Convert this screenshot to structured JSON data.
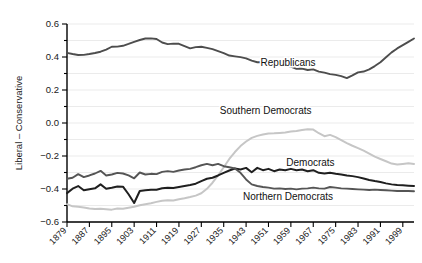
{
  "chart_data": {
    "type": "line",
    "title": "",
    "xlabel": "",
    "ylabel": "Liberal – Conservative",
    "xlim": [
      1879,
      2003
    ],
    "ylim": [
      -0.6,
      0.6
    ],
    "grid": true,
    "legend_position": "inline-annotations",
    "x_tick_labels": [
      "1879",
      "1887",
      "1895",
      "1903",
      "1911",
      "1919",
      "1927",
      "1935",
      "1943",
      "1951",
      "1959",
      "1967",
      "1975",
      "1983",
      "1991",
      "1999"
    ],
    "x_tick_values": [
      1879,
      1887,
      1895,
      1903,
      1911,
      1919,
      1927,
      1935,
      1943,
      1951,
      1959,
      1967,
      1975,
      1983,
      1991,
      1999
    ],
    "y_tick_labels": [
      "0.6",
      "0.4",
      "0.2",
      "0.0",
      "−0.2",
      "−0.4",
      "−0.6"
    ],
    "y_tick_values": [
      0.6,
      0.4,
      0.2,
      0.0,
      -0.2,
      -0.4,
      -0.6
    ],
    "y_minor_tick_values": [
      0.5,
      0.3,
      0.1,
      -0.1,
      -0.3,
      -0.5
    ],
    "x": [
      1879,
      1881,
      1883,
      1885,
      1887,
      1889,
      1891,
      1893,
      1895,
      1897,
      1899,
      1901,
      1903,
      1905,
      1907,
      1909,
      1911,
      1913,
      1915,
      1917,
      1919,
      1921,
      1923,
      1925,
      1927,
      1929,
      1931,
      1933,
      1935,
      1937,
      1939,
      1941,
      1943,
      1945,
      1947,
      1949,
      1951,
      1953,
      1955,
      1957,
      1959,
      1961,
      1963,
      1965,
      1967,
      1969,
      1971,
      1973,
      1975,
      1977,
      1979,
      1981,
      1983,
      1985,
      1987,
      1989,
      1991,
      1993,
      1995,
      1997,
      1999,
      2001,
      2003
    ],
    "series": [
      {
        "name": "Republicans",
        "color": "#4d4d4d",
        "width": 1.9,
        "label_x": 1958,
        "label_y": 0.345,
        "values": [
          0.425,
          0.418,
          0.412,
          0.413,
          0.418,
          0.424,
          0.432,
          0.445,
          0.462,
          0.463,
          0.468,
          0.479,
          0.492,
          0.503,
          0.512,
          0.513,
          0.509,
          0.488,
          0.478,
          0.481,
          0.48,
          0.466,
          0.452,
          0.46,
          0.462,
          0.455,
          0.448,
          0.436,
          0.424,
          0.409,
          0.404,
          0.399,
          0.392,
          0.378,
          0.368,
          0.369,
          0.363,
          0.355,
          0.346,
          0.349,
          0.342,
          0.328,
          0.33,
          0.321,
          0.325,
          0.311,
          0.305,
          0.296,
          0.292,
          0.284,
          0.272,
          0.289,
          0.307,
          0.312,
          0.325,
          0.345,
          0.368,
          0.398,
          0.428,
          0.452,
          0.472,
          0.492,
          0.512
        ]
      },
      {
        "name": "Southern Democrats",
        "color": "#c6c6c6",
        "width": 2.0,
        "label_x": 1950,
        "label_y": 0.055,
        "values": [
          -0.492,
          -0.505,
          -0.508,
          -0.512,
          -0.518,
          -0.521,
          -0.52,
          -0.522,
          -0.525,
          -0.518,
          -0.52,
          -0.514,
          -0.508,
          -0.499,
          -0.492,
          -0.486,
          -0.478,
          -0.471,
          -0.468,
          -0.47,
          -0.462,
          -0.456,
          -0.449,
          -0.44,
          -0.426,
          -0.399,
          -0.362,
          -0.318,
          -0.268,
          -0.218,
          -0.176,
          -0.14,
          -0.112,
          -0.09,
          -0.078,
          -0.07,
          -0.063,
          -0.062,
          -0.06,
          -0.058,
          -0.052,
          -0.048,
          -0.042,
          -0.038,
          -0.04,
          -0.062,
          -0.08,
          -0.072,
          -0.086,
          -0.104,
          -0.122,
          -0.138,
          -0.152,
          -0.168,
          -0.186,
          -0.204,
          -0.218,
          -0.232,
          -0.246,
          -0.252,
          -0.248,
          -0.244,
          -0.248
        ]
      },
      {
        "name": "Democrats",
        "color": "#1f1f1f",
        "width": 2.0,
        "label_x": 1966,
        "label_y": -0.262,
        "values": [
          -0.425,
          -0.398,
          -0.382,
          -0.408,
          -0.402,
          -0.396,
          -0.372,
          -0.398,
          -0.392,
          -0.385,
          -0.386,
          -0.432,
          -0.485,
          -0.412,
          -0.408,
          -0.405,
          -0.404,
          -0.396,
          -0.392,
          -0.394,
          -0.388,
          -0.382,
          -0.376,
          -0.368,
          -0.352,
          -0.338,
          -0.332,
          -0.318,
          -0.302,
          -0.288,
          -0.276,
          -0.282,
          -0.272,
          -0.298,
          -0.272,
          -0.286,
          -0.278,
          -0.292,
          -0.282,
          -0.286,
          -0.278,
          -0.286,
          -0.282,
          -0.292,
          -0.286,
          -0.302,
          -0.306,
          -0.302,
          -0.308,
          -0.312,
          -0.318,
          -0.322,
          -0.328,
          -0.336,
          -0.345,
          -0.352,
          -0.358,
          -0.366,
          -0.372,
          -0.376,
          -0.378,
          -0.38,
          -0.382
        ]
      },
      {
        "name": "Northern Democrats",
        "color": "#555555",
        "width": 1.9,
        "label_x": 1958,
        "label_y": -0.468,
        "values": [
          -0.338,
          -0.332,
          -0.31,
          -0.328,
          -0.318,
          -0.306,
          -0.29,
          -0.318,
          -0.312,
          -0.302,
          -0.306,
          -0.318,
          -0.335,
          -0.3,
          -0.312,
          -0.308,
          -0.31,
          -0.296,
          -0.292,
          -0.296,
          -0.288,
          -0.282,
          -0.278,
          -0.268,
          -0.256,
          -0.248,
          -0.256,
          -0.248,
          -0.262,
          -0.268,
          -0.276,
          -0.302,
          -0.342,
          -0.372,
          -0.382,
          -0.388,
          -0.392,
          -0.398,
          -0.396,
          -0.4,
          -0.398,
          -0.402,
          -0.398,
          -0.396,
          -0.392,
          -0.396,
          -0.398,
          -0.388,
          -0.392,
          -0.396,
          -0.398,
          -0.4,
          -0.402,
          -0.404,
          -0.406,
          -0.404,
          -0.406,
          -0.408,
          -0.41,
          -0.412,
          -0.412,
          -0.412,
          -0.414
        ]
      }
    ]
  }
}
